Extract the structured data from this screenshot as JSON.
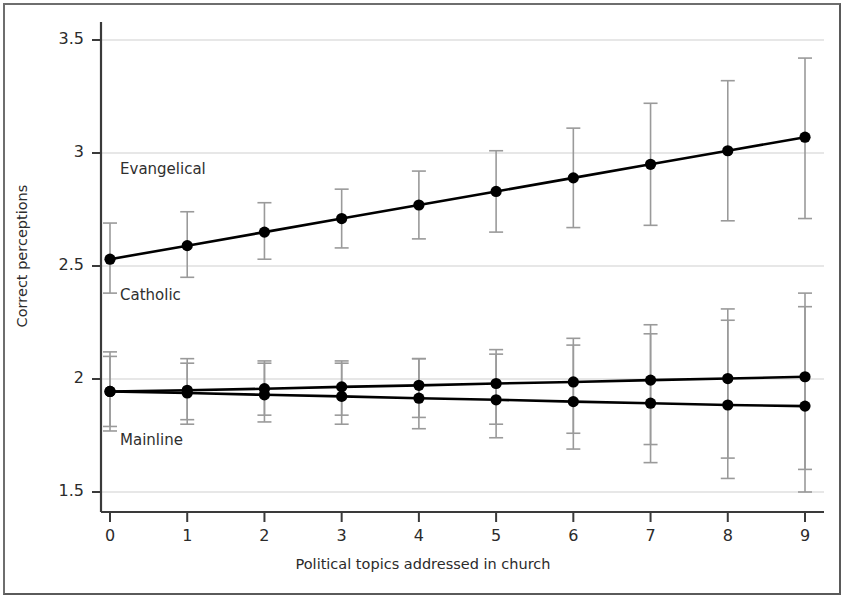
{
  "figure": {
    "background_color": "#ffffff",
    "frame_color": "#5a5a5a",
    "grid_color": "#cfcfcf",
    "axis_color": "#3a3a3a",
    "marker_color": "#000000",
    "errorbar_color": "#9a9a9a"
  },
  "chart_data": {
    "type": "line",
    "title": "",
    "xlabel": "Political topics addressed in church",
    "ylabel": "Correct perceptions",
    "x": [
      0,
      1,
      2,
      3,
      4,
      5,
      6,
      7,
      8,
      9
    ],
    "xticklabels": [
      "0",
      "1",
      "2",
      "3",
      "4",
      "5",
      "6",
      "7",
      "8",
      "9"
    ],
    "yticks": [
      1.5,
      2,
      2.5,
      3,
      3.5
    ],
    "yticklabels": [
      "1.5",
      "2",
      "2.5",
      "3",
      "3.5"
    ],
    "xlim": [
      -0.45,
      9.45
    ],
    "ylim": [
      1.41,
      3.6
    ],
    "grid": "horizontal",
    "legend_position": "inline-annotations",
    "annotations": [
      {
        "text": "Evangelical",
        "x": 0.13,
        "y": 2.93
      },
      {
        "text": "Catholic",
        "x": 0.13,
        "y": 2.37
      },
      {
        "text": "Mainline",
        "x": 0.13,
        "y": 1.73
      }
    ],
    "series": [
      {
        "name": "Evangelical",
        "values": [
          2.53,
          2.59,
          2.65,
          2.71,
          2.77,
          2.83,
          2.89,
          2.95,
          3.01,
          3.07
        ],
        "ci_low": [
          2.38,
          2.45,
          2.53,
          2.58,
          2.62,
          2.65,
          2.67,
          2.68,
          2.7,
          2.71
        ],
        "ci_high": [
          2.69,
          2.74,
          2.78,
          2.84,
          2.92,
          3.01,
          3.11,
          3.22,
          3.32,
          3.42
        ]
      },
      {
        "name": "Catholic",
        "values": [
          1.945,
          1.95,
          1.957,
          1.965,
          1.972,
          1.98,
          1.987,
          1.995,
          2.002,
          2.01
        ],
        "ci_low": [
          1.79,
          1.82,
          1.84,
          1.84,
          1.83,
          1.8,
          1.76,
          1.71,
          1.65,
          1.6
        ],
        "ci_high": [
          2.1,
          2.07,
          2.07,
          2.07,
          2.09,
          2.13,
          2.18,
          2.24,
          2.31,
          2.38
        ]
      },
      {
        "name": "Mainline",
        "values": [
          1.945,
          1.938,
          1.93,
          1.923,
          1.915,
          1.908,
          1.9,
          1.893,
          1.885,
          1.88
        ],
        "ci_low": [
          1.77,
          1.8,
          1.81,
          1.8,
          1.78,
          1.74,
          1.69,
          1.63,
          1.56,
          1.5
        ],
        "ci_high": [
          2.12,
          2.09,
          2.08,
          2.08,
          2.09,
          2.11,
          2.15,
          2.2,
          2.26,
          2.32
        ]
      }
    ]
  }
}
